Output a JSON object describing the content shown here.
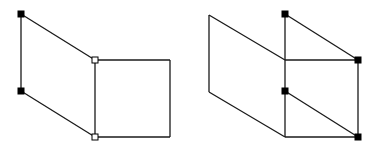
{
  "figures": [
    {
      "name": "left-figure",
      "edges": [
        [
          21,
          14,
          95,
          60
        ],
        [
          21,
          14,
          21,
          91
        ],
        [
          21,
          91,
          95,
          137
        ],
        [
          95,
          60,
          95,
          137
        ],
        [
          95,
          60,
          170,
          60
        ],
        [
          170,
          60,
          170,
          137
        ],
        [
          95,
          137,
          170,
          137
        ]
      ],
      "handles": [
        {
          "x": 21,
          "y": 14,
          "style": "filled"
        },
        {
          "x": 21,
          "y": 91,
          "style": "filled"
        },
        {
          "x": 95,
          "y": 60,
          "style": "hollow"
        },
        {
          "x": 95,
          "y": 137,
          "style": "hollow"
        }
      ]
    },
    {
      "name": "right-figure",
      "edges": [
        [
          209,
          15,
          285,
          60
        ],
        [
          209,
          15,
          209,
          92
        ],
        [
          209,
          92,
          285,
          137
        ],
        [
          285,
          14,
          285,
          137
        ],
        [
          285,
          60,
          358,
          60
        ],
        [
          285,
          137,
          358,
          137
        ],
        [
          285,
          14,
          358,
          60
        ],
        [
          285,
          91,
          358,
          137
        ],
        [
          358,
          60,
          358,
          137
        ]
      ],
      "handles": [
        {
          "x": 285,
          "y": 14,
          "style": "filled"
        },
        {
          "x": 285,
          "y": 91,
          "style": "filled"
        },
        {
          "x": 358,
          "y": 60,
          "style": "filled"
        },
        {
          "x": 358,
          "y": 137,
          "style": "filled"
        }
      ]
    }
  ],
  "colors": {
    "stroke": "#1a1a1a",
    "background": "#ffffff"
  }
}
